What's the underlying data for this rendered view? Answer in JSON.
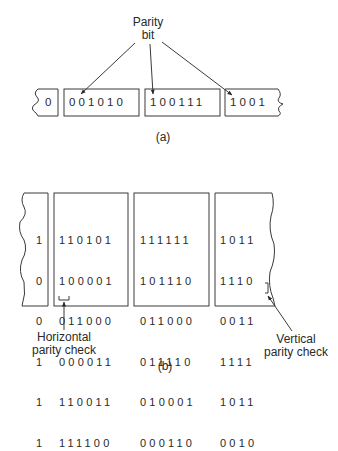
{
  "part_a": {
    "label": "Parity bit",
    "label_line1": "Parity",
    "label_line2": "bit",
    "caption": "(a)",
    "frames": [
      "0",
      "001010",
      "100111",
      "1001"
    ]
  },
  "part_b": {
    "caption": "(b)",
    "partial_column": [
      "1",
      "0",
      "0",
      "1",
      "1",
      "1"
    ],
    "blocks": [
      [
        "110101",
        "100001",
        "011000",
        "000011",
        "110011",
        "111100"
      ],
      [
        "111111",
        "101110",
        "011000",
        "011110",
        "010001",
        "000110"
      ],
      [
        "1011",
        "1110",
        "0011",
        "1111",
        "1011",
        "0010"
      ]
    ],
    "horizontal_label_line1": "Horizontal",
    "horizontal_label_line2": "parity check",
    "vertical_label_line1": "Vertical",
    "vertical_label_line2": "parity check"
  }
}
